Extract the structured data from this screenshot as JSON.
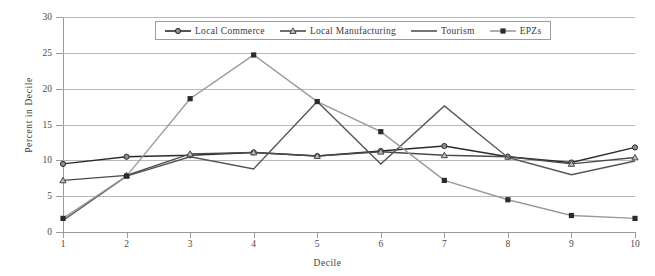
{
  "chart_data": {
    "type": "line",
    "title": "",
    "xlabel": "Decile",
    "ylabel": "Percent in Decile",
    "x": [
      1,
      2,
      3,
      4,
      5,
      6,
      7,
      8,
      9,
      10
    ],
    "xticklabels": [
      "1",
      "2",
      "3",
      "4",
      "5",
      "6",
      "7",
      "8",
      "9",
      "10"
    ],
    "yticklabels": [
      "0",
      "5",
      "10",
      "15",
      "20",
      "25",
      "30"
    ],
    "yticks": [
      0,
      5,
      10,
      15,
      20,
      25,
      30
    ],
    "ylim": [
      0,
      30
    ],
    "xlim": [
      1,
      10
    ],
    "grid": "horizontal",
    "legend_position": "top-center-inside",
    "series": [
      {
        "name": "Local Commerce",
        "marker": "circle",
        "color": "#2b2b2b",
        "values": [
          9.5,
          10.5,
          10.7,
          11.1,
          10.6,
          11.3,
          12.0,
          10.5,
          9.7,
          11.8
        ]
      },
      {
        "name": "Local Manufacturing",
        "marker": "triangle",
        "color": "#4a4a4a",
        "values": [
          7.2,
          7.9,
          10.9,
          11.1,
          10.6,
          11.2,
          10.7,
          10.5,
          9.5,
          10.4
        ]
      },
      {
        "name": "Tourism",
        "marker": "none",
        "color": "#555555",
        "values": [
          1.6,
          7.8,
          10.5,
          8.8,
          18.2,
          9.5,
          17.6,
          10.4,
          8.0,
          9.9
        ]
      },
      {
        "name": "EPZs",
        "marker": "square",
        "color": "#9a9a9a",
        "values": [
          1.9,
          7.8,
          18.6,
          24.7,
          18.2,
          14.0,
          7.2,
          4.5,
          2.3,
          1.9
        ]
      }
    ]
  },
  "legend": {
    "items": [
      {
        "label": "Local Commerce"
      },
      {
        "label": "Local Manufacturing"
      },
      {
        "label": "Tourism"
      },
      {
        "label": "EPZs"
      }
    ]
  }
}
